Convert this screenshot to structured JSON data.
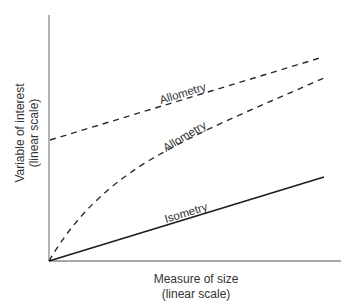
{
  "diagram": {
    "type": "conceptual-line-diagram",
    "x_axis": {
      "label_line1": "Measure of size",
      "label_line2": "(linear scale)"
    },
    "y_axis": {
      "label_line1": "Variable of interest",
      "label_line2": "(linear scale)"
    },
    "curves": [
      {
        "id": "allometry-upper",
        "label": "Allometry",
        "style": "dashed",
        "shape": "straight line with positive intercept"
      },
      {
        "id": "allometry-lower",
        "label": "Allometry",
        "style": "dashed",
        "shape": "concave curve through origin"
      },
      {
        "id": "isometry",
        "label": "Isometry",
        "style": "solid",
        "shape": "straight line through origin"
      }
    ],
    "colors": {
      "axis": "#8a8a8a",
      "line": "#1a1a1a",
      "text": "#333333"
    }
  }
}
